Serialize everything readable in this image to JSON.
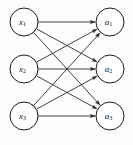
{
  "figure": {
    "type": "bipartite-graph-diagram",
    "width": 133,
    "height": 145,
    "background_color": "#fdfdfc",
    "stroke_color": "#2a2a2a",
    "node_fill_color": "#ffffff",
    "node_stroke_color": "#1c1c1c"
  },
  "nodes": {
    "left_column": [
      {
        "id": "x1",
        "base": "x",
        "sub": "1",
        "cx": 24,
        "cy": 22,
        "r": 14
      },
      {
        "id": "x2",
        "base": "x",
        "sub": "2",
        "cx": 24,
        "cy": 69,
        "r": 14
      },
      {
        "id": "x3",
        "base": "x",
        "sub": "3",
        "cx": 24,
        "cy": 116,
        "r": 14
      }
    ],
    "right_column": [
      {
        "id": "a1",
        "base": "a",
        "sub": "1",
        "cx": 110,
        "cy": 22,
        "r": 14
      },
      {
        "id": "a2",
        "base": "a",
        "sub": "2",
        "cx": 110,
        "cy": 69,
        "r": 14
      },
      {
        "id": "a3",
        "base": "a",
        "sub": "3",
        "cx": 110,
        "cy": 116,
        "r": 14
      }
    ]
  },
  "edges": [
    {
      "from": "x1",
      "to": "a1",
      "arrows": "both"
    },
    {
      "from": "x1",
      "to": "a2",
      "arrows": "both"
    },
    {
      "from": "x1",
      "to": "a3",
      "arrows": "both"
    },
    {
      "from": "x2",
      "to": "a1",
      "arrows": "both"
    },
    {
      "from": "x2",
      "to": "a2",
      "arrows": "both"
    },
    {
      "from": "x2",
      "to": "a3",
      "arrows": "both"
    },
    {
      "from": "x3",
      "to": "a1",
      "arrows": "both"
    },
    {
      "from": "x3",
      "to": "a2",
      "arrows": "both"
    },
    {
      "from": "x3",
      "to": "a3",
      "arrows": "both"
    }
  ]
}
